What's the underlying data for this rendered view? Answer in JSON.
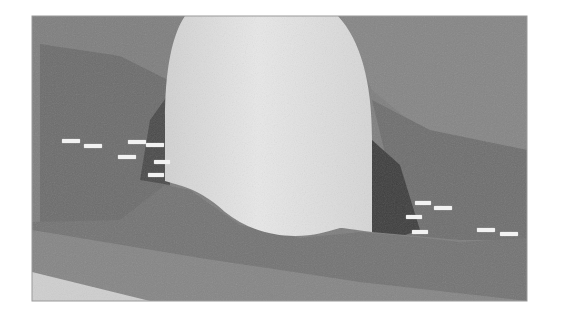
{
  "figure": {
    "type": "3d-geological-model",
    "colors": {
      "background": "#ffffff",
      "upper_stratum": "#7c7c7c",
      "middle_stratum": "#6a6a6a",
      "dark_zone": "#3e3e3e",
      "lower_stratum": "#757575",
      "base_stratum": "#8a8a8a",
      "dome": "#dedede",
      "floor": "#cfcfcf"
    },
    "labels_left": [
      {
        "x": 62,
        "y": 139,
        "w": 18,
        "text": ""
      },
      {
        "x": 84,
        "y": 144,
        "w": 18,
        "text": ""
      },
      {
        "x": 128,
        "y": 140,
        "w": 18,
        "text": ""
      },
      {
        "x": 146,
        "y": 143,
        "w": 18,
        "text": ""
      },
      {
        "x": 118,
        "y": 155,
        "w": 18,
        "text": ""
      },
      {
        "x": 154,
        "y": 160,
        "w": 16,
        "text": ""
      },
      {
        "x": 148,
        "y": 173,
        "w": 16,
        "text": ""
      }
    ],
    "labels_right": [
      {
        "x": 415,
        "y": 201,
        "w": 16,
        "text": ""
      },
      {
        "x": 434,
        "y": 206,
        "w": 18,
        "text": ""
      },
      {
        "x": 406,
        "y": 215,
        "w": 16,
        "text": ""
      },
      {
        "x": 412,
        "y": 230,
        "w": 16,
        "text": ""
      },
      {
        "x": 477,
        "y": 228,
        "w": 18,
        "text": ""
      },
      {
        "x": 500,
        "y": 232,
        "w": 18,
        "text": ""
      }
    ]
  }
}
